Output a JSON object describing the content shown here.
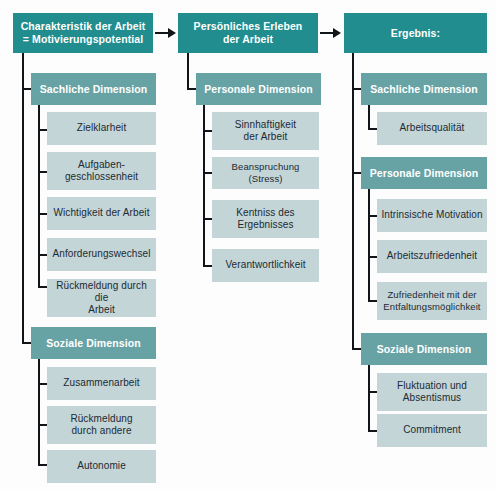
{
  "diagram": {
    "title_text": "Charakteristik der Arbeit = Motivierungspotential",
    "colors": {
      "header_box": "#218d8e",
      "dimension_box": "#67a3a5",
      "leaf_box": "#c3d5d7",
      "connector": "#111418",
      "background": "#fdfdfd",
      "header_text": "#ffffff",
      "leaf_text": "#1c2a33"
    },
    "columns": [
      {
        "id": "column-1",
        "header": {
          "line1": "Charakteristik der Arbeit",
          "line2": "= Motivierungspotential"
        },
        "groups": [
          {
            "id": "group-sachliche-dimension-1",
            "label": "Sachliche Dimension",
            "items": [
              {
                "line1": "Zielklarheit",
                "line2": ""
              },
              {
                "line1": "Aufgaben-",
                "line2": "geschlossenheit"
              },
              {
                "line1": "Wichtigkeit der Arbeit",
                "line2": ""
              },
              {
                "line1": "Anforderungswechsel",
                "line2": ""
              },
              {
                "line1": "Rückmeldung durch die",
                "line2": "Arbeit"
              }
            ]
          },
          {
            "id": "group-soziale-dimension-1",
            "label": "Soziale Dimension",
            "items": [
              {
                "line1": "Zusammenarbeit",
                "line2": ""
              },
              {
                "line1": "Rückmeldung",
                "line2": "durch andere"
              },
              {
                "line1": "Autonomie",
                "line2": ""
              }
            ]
          }
        ]
      },
      {
        "id": "column-2",
        "header": {
          "line1": "Persönliches Erleben",
          "line2": "der Arbeit"
        },
        "groups": [
          {
            "id": "group-personale-dimension-2",
            "label": "Personale Dimension",
            "items": [
              {
                "line1": "Sinnhaftigkeit",
                "line2": "der Arbeit"
              },
              {
                "line1": "Beanspruchung (Stress)",
                "line2": ""
              },
              {
                "line1": "Kentniss des",
                "line2": "Ergebnisses"
              },
              {
                "line1": "Verantwortlichkeit",
                "line2": ""
              }
            ]
          }
        ]
      },
      {
        "id": "column-3",
        "header": {
          "line1": "Ergebnis:",
          "line2": ""
        },
        "groups": [
          {
            "id": "group-sachliche-dimension-3",
            "label": "Sachliche Dimension",
            "items": [
              {
                "line1": "Arbeitsqualität",
                "line2": ""
              }
            ]
          },
          {
            "id": "group-personale-dimension-3",
            "label": "Personale Dimension",
            "items": [
              {
                "line1": "Intrinsische Motivation",
                "line2": ""
              },
              {
                "line1": "Arbeitszufriedenheit",
                "line2": ""
              },
              {
                "line1": "Zufriedenheit mit der",
                "line2": "Entfaltungsmöglichkeit"
              }
            ]
          },
          {
            "id": "group-soziale-dimension-3",
            "label": "Soziale Dimension",
            "items": [
              {
                "line1": "Fluktuation und",
                "line2": "Absentismus"
              },
              {
                "line1": "Commitment",
                "line2": ""
              }
            ]
          }
        ]
      }
    ],
    "arrows": [
      {
        "id": "arrow-col1-to-col2",
        "name": "arrow-right-icon"
      },
      {
        "id": "arrow-col2-to-col3",
        "name": "arrow-right-icon"
      }
    ]
  }
}
